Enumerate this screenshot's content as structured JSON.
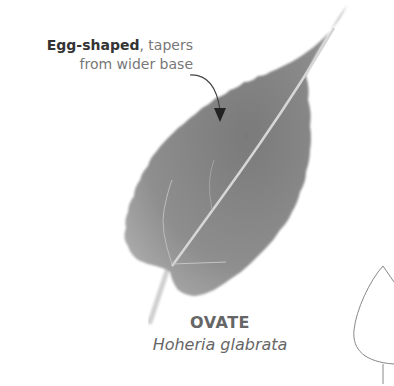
{
  "annotation": {
    "bold_text": "Egg-shaped",
    "rest_line1": ", tapers",
    "line2": "from wider base"
  },
  "shape": {
    "name": "OVATE",
    "species": "Hoheria glabrata"
  },
  "colors": {
    "leaf_fill": "#8a8a8a",
    "leaf_dark": "#6e6e6e",
    "vein": "#d8d8d8",
    "text_bold": "#333333",
    "text_light": "#777777",
    "outline": "#888888"
  }
}
